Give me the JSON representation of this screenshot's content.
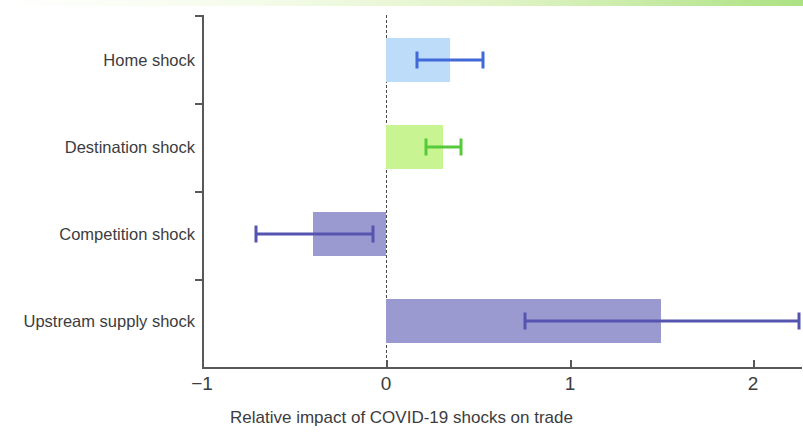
{
  "chart_data": {
    "type": "bar",
    "orientation": "horizontal",
    "title": "",
    "xlabel": "Relative impact of COVID-19 shocks on trade",
    "ylabel": "",
    "xlim": [
      -1.1,
      2.37
    ],
    "xticks": [
      -1,
      0,
      1,
      2
    ],
    "xtick_labels": [
      "−1",
      "0",
      "1",
      "2"
    ],
    "grid": false,
    "legend": "none",
    "zero_reference_line": 0,
    "categories": [
      "Home shock",
      "Destination shock",
      "Competition shock",
      "Upstream supply shock"
    ],
    "values": [
      0.35,
      0.31,
      -0.4,
      1.5
    ],
    "error_low": [
      0.17,
      0.22,
      -0.71,
      0.76
    ],
    "error_high": [
      0.53,
      0.41,
      -0.07,
      2.25
    ],
    "bar_colors": [
      "#bcdcfa",
      "#c8f591",
      "#9a9ad0",
      "#9a9ad0"
    ],
    "error_colors": [
      "#4169d8",
      "#56c93c",
      "#5554b0",
      "#5554b0"
    ],
    "bars": [
      {
        "label": "Home shock",
        "value": 0.35,
        "ci_low": 0.17,
        "ci_high": 0.53,
        "bar_color": "#bcdcfa",
        "error_color": "#4169d8"
      },
      {
        "label": "Destination shock",
        "value": 0.31,
        "ci_low": 0.22,
        "ci_high": 0.41,
        "bar_color": "#c8f591",
        "error_color": "#56c93c"
      },
      {
        "label": "Competition shock",
        "value": -0.4,
        "ci_low": -0.71,
        "ci_high": -0.07,
        "bar_color": "#9a9ad0",
        "error_color": "#5554b0"
      },
      {
        "label": "Upstream supply shock",
        "value": 1.5,
        "ci_low": 0.76,
        "ci_high": 2.25,
        "bar_color": "#9a9ad0",
        "error_color": "#5554b0"
      }
    ]
  },
  "axis": {
    "color": "#58585a",
    "tick_label_0": "−1",
    "tick_label_1": "0",
    "tick_label_2": "1",
    "tick_label_3": "2",
    "x_title": "Relative impact of COVID-19 shocks on trade"
  },
  "decor": {
    "top_stripe_color": "#a8e07c"
  }
}
